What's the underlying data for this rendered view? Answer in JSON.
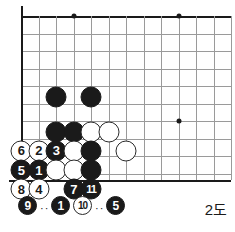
{
  "diagram": {
    "caption": "2도",
    "kind": "go-board-corner-diagram",
    "orientation": "top-left corner, bottom edge shown"
  },
  "board": {
    "origin_x": 21,
    "origin_y": 16,
    "spacing": 17.5,
    "cols": 12,
    "rows": 10,
    "bottom_edge_y": 180,
    "line_color": "#9a9a9a",
    "edge_color": "#1a1a1a",
    "star_points": [
      {
        "col": 3,
        "row": 0
      },
      {
        "col": 9,
        "row": 0
      },
      {
        "col": 9,
        "row": 6
      }
    ]
  },
  "stones": [
    {
      "col": 2,
      "row": 4.6,
      "color": "black",
      "label": ""
    },
    {
      "col": 4,
      "row": 4.6,
      "color": "black",
      "label": ""
    },
    {
      "col": 2,
      "row": 6.6,
      "color": "black",
      "label": ""
    },
    {
      "col": 3,
      "row": 6.6,
      "color": "black",
      "label": ""
    },
    {
      "col": 4,
      "row": 6.6,
      "color": "white",
      "label": ""
    },
    {
      "col": 5,
      "row": 6.6,
      "color": "white",
      "label": ""
    },
    {
      "col": 0,
      "row": 7.7,
      "color": "white",
      "label": "6"
    },
    {
      "col": 1,
      "row": 7.7,
      "color": "white",
      "label": "2"
    },
    {
      "col": 2,
      "row": 7.7,
      "color": "black",
      "label": "3"
    },
    {
      "col": 3,
      "row": 7.7,
      "color": "white",
      "label": ""
    },
    {
      "col": 4,
      "row": 7.7,
      "color": "black",
      "label": ""
    },
    {
      "col": 6,
      "row": 7.7,
      "color": "white",
      "label": ""
    },
    {
      "col": 0,
      "row": 8.8,
      "color": "black",
      "label": "5"
    },
    {
      "col": 1,
      "row": 8.8,
      "color": "black",
      "label": "1"
    },
    {
      "col": 2,
      "row": 8.8,
      "color": "white",
      "label": ""
    },
    {
      "col": 3,
      "row": 8.8,
      "color": "white",
      "label": ""
    },
    {
      "col": 4,
      "row": 8.8,
      "color": "black",
      "label": ""
    },
    {
      "col": 0,
      "row": 9.9,
      "color": "white",
      "label": "8"
    },
    {
      "col": 1,
      "row": 9.9,
      "color": "white",
      "label": "4"
    },
    {
      "col": 3,
      "row": 9.9,
      "color": "black",
      "label": "7"
    },
    {
      "col": 4,
      "row": 9.9,
      "color": "black",
      "label": "11"
    }
  ],
  "legend": {
    "items": [
      {
        "type": "stone",
        "color": "black",
        "label": "9",
        "x": 18
      },
      {
        "type": "dots",
        "text": "··",
        "x": 40
      },
      {
        "type": "stone",
        "color": "black",
        "label": "1",
        "x": 51
      },
      {
        "type": "stone",
        "color": "white",
        "label": "10",
        "x": 73
      },
      {
        "type": "dots",
        "text": "··",
        "x": 95
      },
      {
        "type": "stone",
        "color": "black",
        "label": "5",
        "x": 106
      }
    ]
  }
}
